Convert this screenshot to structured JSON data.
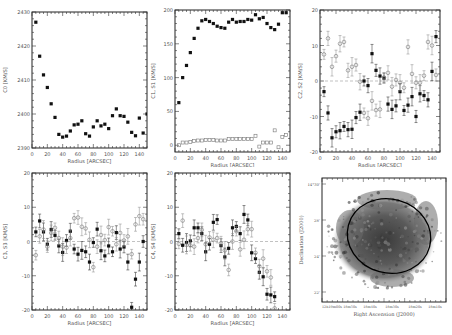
{
  "chart_data": [
    {
      "id": "c0",
      "type": "scatter",
      "title": "",
      "xlabel": "Radius [ARCSEC]",
      "ylabel": "C0 [KM/S]",
      "xlim": [
        0,
        150
      ],
      "ylim": [
        2390,
        2430
      ],
      "xticks": [
        0,
        20,
        40,
        60,
        80,
        100,
        120,
        140
      ],
      "yticks": [
        2390,
        2400,
        2410,
        2420,
        2430
      ],
      "grid": false,
      "series": [
        {
          "name": "C0",
          "marker": "filled-square",
          "x": [
            5,
            10,
            15,
            20,
            25,
            30,
            35,
            40,
            45,
            50,
            55,
            60,
            65,
            70,
            75,
            80,
            85,
            90,
            95,
            100,
            105,
            110,
            115,
            120,
            125,
            130,
            135,
            140,
            145,
            150
          ],
          "y": [
            2427,
            2417,
            2411.5,
            2407.8,
            2403,
            2399,
            2394,
            2393.2,
            2393.5,
            2395,
            2396.8,
            2397,
            2398,
            2394.2,
            2393.5,
            2396.2,
            2398,
            2396.5,
            2397,
            2395.7,
            2399.5,
            2401.5,
            2399.5,
            2399.3,
            2397.6,
            2394.6,
            2393.6,
            2398.8,
            2394.4,
            2400
          ]
        }
      ]
    },
    {
      "id": "c1s1",
      "type": "scatter",
      "xlabel": "Radius [ARCSEC]",
      "ylabel": "C1, S1 [KM/S]",
      "xlim": [
        0,
        150
      ],
      "ylim": [
        -10,
        200
      ],
      "xticks": [
        0,
        20,
        40,
        60,
        80,
        100,
        120,
        140
      ],
      "yticks": [
        0,
        50,
        100,
        150,
        200
      ],
      "grid": false,
      "series": [
        {
          "name": "C1",
          "marker": "filled-square",
          "x": [
            5,
            10,
            15,
            20,
            25,
            30,
            35,
            40,
            45,
            50,
            55,
            60,
            65,
            70,
            75,
            80,
            85,
            90,
            95,
            100,
            105,
            110,
            115,
            120,
            125,
            130,
            135,
            140,
            145
          ],
          "y": [
            63,
            100,
            118,
            137,
            158,
            173,
            184,
            186,
            183,
            180,
            176,
            174,
            173,
            182,
            186,
            182,
            183,
            183,
            186,
            185,
            193,
            187,
            189,
            180,
            174,
            171,
            179,
            196,
            196
          ]
        },
        {
          "name": "S1",
          "marker": "open-square",
          "x": [
            5,
            10,
            15,
            20,
            25,
            30,
            35,
            40,
            45,
            50,
            55,
            60,
            65,
            70,
            75,
            80,
            85,
            90,
            95,
            100,
            105,
            110,
            115,
            120,
            125,
            130,
            135,
            140,
            145
          ],
          "y": [
            0,
            4,
            4,
            5,
            6,
            7,
            7,
            8,
            8,
            8,
            7,
            7,
            7,
            9,
            9,
            9,
            9,
            9,
            9,
            9,
            14,
            -2,
            4,
            4,
            4,
            22,
            -3,
            12,
            15
          ]
        }
      ]
    },
    {
      "id": "c2s2",
      "type": "scatter",
      "xlabel": "Radius [ARCSEC]",
      "ylabel": "C2, S2 [KM/S]",
      "xlim": [
        0,
        150
      ],
      "ylim": [
        -20,
        20
      ],
      "xticks": [
        0,
        20,
        40,
        60,
        80,
        100,
        120,
        140
      ],
      "yticks": [
        -20,
        -10,
        0,
        10,
        20
      ],
      "zero_line": true,
      "series": [
        {
          "name": "C2",
          "marker": "filled-square",
          "x": [
            5,
            10,
            15,
            20,
            25,
            30,
            35,
            40,
            45,
            50,
            55,
            60,
            65,
            70,
            75,
            80,
            85,
            90,
            95,
            100,
            105,
            110,
            115,
            120,
            125,
            130,
            135,
            140,
            145
          ],
          "y": [
            -3,
            -9,
            -16,
            -14.3,
            -14,
            -12.8,
            -13.7,
            -13.6,
            -10.3,
            -8.8,
            0,
            -1.3,
            7.7,
            3,
            1.4,
            0.8,
            -6.5,
            -8,
            -7,
            -3,
            -8.3,
            -6.8,
            -4.4,
            -10,
            -3.6,
            -4.1,
            -5.3,
            2.7,
            12.5
          ]
        },
        {
          "name": "S2",
          "marker": "open-circle",
          "x": [
            5,
            10,
            15,
            20,
            25,
            30,
            35,
            40,
            45,
            50,
            55,
            60,
            65,
            70,
            75,
            80,
            85,
            90,
            95,
            100,
            105,
            110,
            115,
            120,
            125,
            130,
            135,
            140,
            145
          ],
          "y": [
            7.5,
            12,
            4,
            7,
            10.5,
            11,
            3,
            4,
            4.5,
            -0.2,
            -9,
            -10.5,
            -5.6,
            -8.2,
            -8,
            1,
            2.3,
            -1.6,
            0.3,
            -0.5,
            -1.9,
            9.6,
            2,
            -0.5,
            -0.5,
            1.5,
            11,
            10,
            1.7
          ]
        }
      ]
    },
    {
      "id": "c3s3",
      "type": "scatter",
      "xlabel": "Radius [ARCSEC]",
      "ylabel": "C3, S3 [KM/S]",
      "xlim": [
        0,
        150
      ],
      "ylim": [
        -20,
        20
      ],
      "xticks": [
        0,
        20,
        40,
        60,
        80,
        100,
        120,
        140
      ],
      "yticks": [
        -20,
        -10,
        0,
        10,
        20
      ],
      "zero_line": true,
      "series": [
        {
          "name": "C3",
          "marker": "filled-square",
          "x": [
            5,
            10,
            15,
            20,
            25,
            30,
            35,
            40,
            45,
            50,
            55,
            60,
            65,
            70,
            75,
            80,
            85,
            90,
            95,
            100,
            105,
            110,
            115,
            120,
            125,
            130,
            135,
            140,
            145,
            150
          ],
          "y": [
            2.8,
            6,
            2.8,
            -0.8,
            3.5,
            1.8,
            -1.3,
            -3.2,
            0.3,
            3,
            -2.2,
            -3.7,
            -2.6,
            -3,
            -6,
            -0.3,
            3.6,
            -2.7,
            -4.2,
            -1.3,
            -3,
            2.6,
            -2.2,
            -1.6,
            -6,
            -19.2,
            -11,
            -6,
            0
          ]
        },
        {
          "name": "S3",
          "marker": "open-circle",
          "x": [
            5,
            10,
            15,
            20,
            25,
            30,
            35,
            40,
            45,
            50,
            55,
            60,
            65,
            70,
            75,
            80,
            85,
            90,
            95,
            100,
            105,
            110,
            115,
            120,
            125,
            130,
            135,
            140,
            145
          ],
          "y": [
            -4,
            1.5,
            3.5,
            -1.5,
            2.5,
            4,
            1,
            -1.5,
            -1.8,
            1,
            6.8,
            7,
            4.3,
            3.8,
            0.5,
            -7.5,
            -1.5,
            1.9,
            0.4,
            4.2,
            3,
            -0.8,
            2.5,
            0.3,
            1.5,
            -3.7,
            5,
            7.4,
            6.5
          ]
        }
      ]
    },
    {
      "id": "c4s4",
      "type": "scatter",
      "xlabel": "Radius [ARCSEC]",
      "ylabel": "C4, S4 [KM/S]",
      "xlim": [
        0,
        150
      ],
      "ylim": [
        -20,
        20
      ],
      "xticks": [
        0,
        20,
        40,
        60,
        80,
        100,
        120,
        140
      ],
      "yticks": [
        -20,
        -10,
        0,
        10,
        20
      ],
      "zero_line": true,
      "series": [
        {
          "name": "C4",
          "marker": "filled-square",
          "x": [
            5,
            10,
            15,
            20,
            25,
            30,
            35,
            40,
            45,
            50,
            55,
            60,
            65,
            70,
            75,
            80,
            85,
            90,
            95,
            100,
            105,
            110,
            115,
            120,
            125,
            130
          ],
          "y": [
            2.3,
            -1.1,
            -0.3,
            0.2,
            4,
            4,
            2.3,
            -3,
            -0.8,
            5.6,
            6.4,
            -1.2,
            -4.5,
            -2,
            4,
            4.4,
            2.3,
            7.9,
            6.3,
            -3.3,
            -5,
            -9,
            -10.3,
            -15.4,
            -15.6,
            -16.1
          ]
        },
        {
          "name": "S4",
          "marker": "open-circle",
          "x": [
            5,
            10,
            15,
            20,
            25,
            30,
            35,
            40,
            45,
            50,
            55,
            60,
            65,
            70,
            75,
            80,
            85,
            90,
            95,
            100,
            105,
            110,
            115,
            120,
            125,
            130
          ],
          "y": [
            -0.7,
            6.1,
            -1,
            -1.1,
            -1.5,
            1,
            3.4,
            -0.8,
            1.2,
            0.5,
            1,
            -0.5,
            -2.6,
            -8.3,
            0,
            3,
            -2.3,
            0.5,
            3.6,
            3.6,
            -3.3,
            -7.2,
            -5,
            -8.7,
            -10.5,
            -19.5
          ]
        }
      ]
    },
    {
      "id": "map",
      "type": "heatmap",
      "xlabel": "Right Ascension (J2000)",
      "ylabel": "Declination (J2000)",
      "xticks": [
        "12h19m00s",
        "18m50s",
        "18m40s",
        "18m30s",
        "18m20s",
        "18m10s"
      ],
      "yticks": [
        "14°30'",
        "28'",
        "24'",
        "22'"
      ],
      "annotation": "ellipse (fitted ring)"
    }
  ]
}
